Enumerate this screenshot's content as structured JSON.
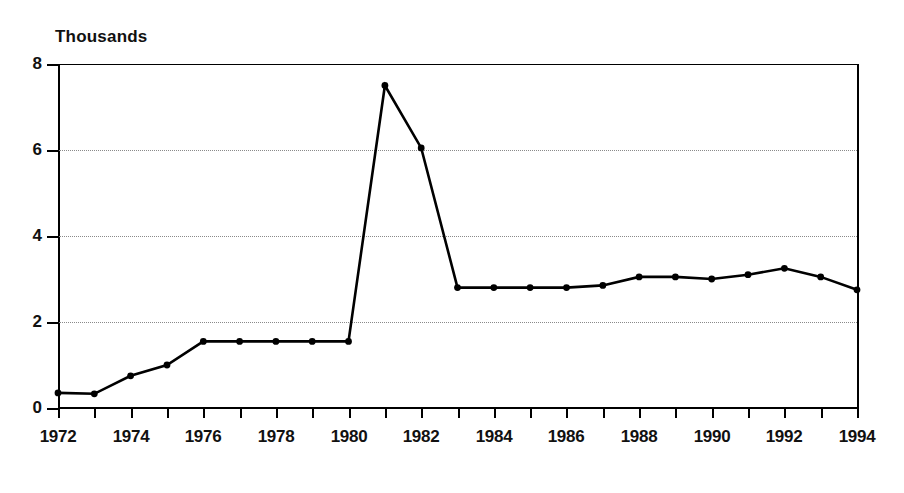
{
  "chart_data": {
    "type": "line",
    "title": "",
    "unit_label": "Thousands",
    "xlabel": "",
    "ylabel": "",
    "xlim": [
      1972,
      1994
    ],
    "ylim": [
      0,
      8
    ],
    "ytick_values": [
      0,
      2,
      4,
      6,
      8
    ],
    "ytick_labels": [
      "0",
      "2",
      "4",
      "6",
      "8"
    ],
    "xtick_values": [
      1972,
      1973,
      1974,
      1975,
      1976,
      1977,
      1978,
      1979,
      1980,
      1981,
      1982,
      1983,
      1984,
      1985,
      1986,
      1987,
      1988,
      1989,
      1990,
      1991,
      1992,
      1993,
      1994
    ],
    "xtick_labels_shown": [
      "1972",
      "1974",
      "1976",
      "1978",
      "1980",
      "1982",
      "1984",
      "1986",
      "1988",
      "1990",
      "1992",
      "1994"
    ],
    "grid": true,
    "grid_style": "dotted",
    "grid_axis": "y",
    "legend": false,
    "markers": true,
    "line_color": "#000000",
    "background_color": "#ffffff",
    "x": [
      1972,
      1973,
      1974,
      1975,
      1976,
      1977,
      1978,
      1979,
      1980,
      1981,
      1982,
      1983,
      1984,
      1985,
      1986,
      1987,
      1988,
      1989,
      1990,
      1991,
      1992,
      1993,
      1994
    ],
    "values": [
      0.35,
      0.33,
      0.75,
      1.0,
      1.55,
      1.55,
      1.55,
      1.55,
      1.55,
      7.5,
      6.05,
      2.8,
      2.8,
      2.8,
      2.8,
      2.85,
      3.05,
      3.05,
      3.0,
      3.1,
      3.25,
      3.05,
      2.75
    ],
    "annotations": []
  }
}
